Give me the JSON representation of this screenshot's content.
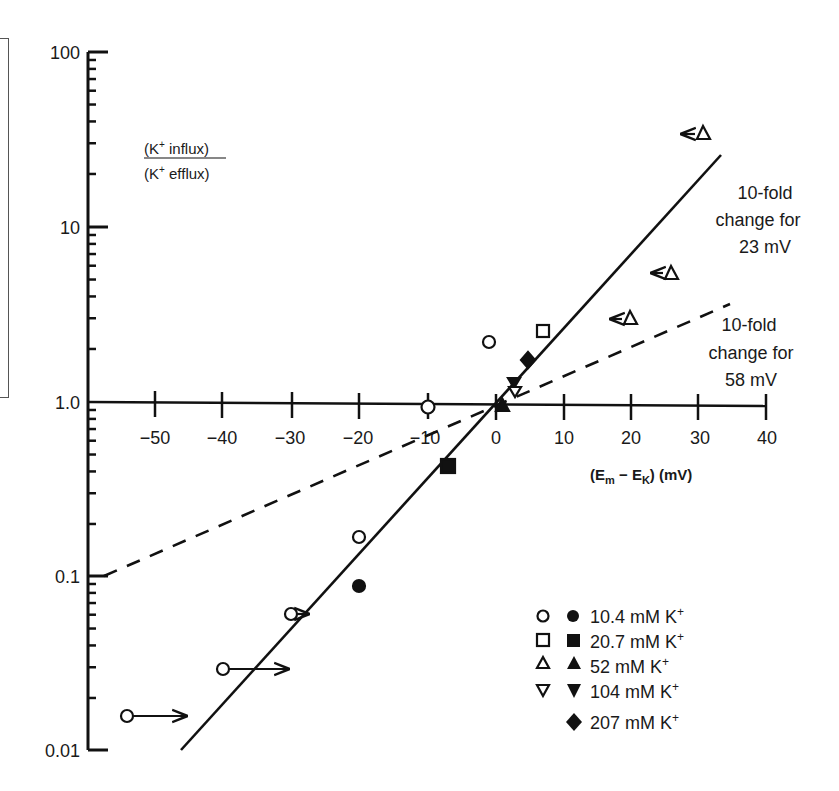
{
  "chart_data": {
    "type": "scatter",
    "title": "",
    "xlabel": "(Em − EK) (mV)",
    "ylabel": "(K+ influx) / (K+ efflux)",
    "ylabel_numerator": "(K+ influx)",
    "ylabel_denominator": "(K+ efflux)",
    "yscale": "log",
    "xlim": [
      -55,
      40
    ],
    "ylim": [
      0.01,
      100
    ],
    "x_ticks": [
      -50,
      -40,
      -30,
      -20,
      -10,
      0,
      10,
      20,
      30,
      40
    ],
    "x_tick_labels": [
      "−50",
      "−40",
      "−30",
      "−20",
      "−10",
      "0",
      "10",
      "20",
      "30",
      "40"
    ],
    "y_ticks": [
      100,
      10,
      1.0,
      0.1,
      0.01
    ],
    "y_tick_labels": [
      "100",
      "10",
      "1.0",
      "0.1",
      "0.01"
    ],
    "grid": false,
    "legend_position": "lower right",
    "series": [
      {
        "name": "10.4 mM K+",
        "marker": "circle",
        "open_points": [
          {
            "x": -53.5,
            "y": 0.016,
            "arrow": "right"
          },
          {
            "x": -40,
            "y": 0.029,
            "arrow": "right"
          },
          {
            "x": -30,
            "y": 0.061,
            "arrow": "right"
          },
          {
            "x": -20,
            "y": 0.17
          },
          {
            "x": -10,
            "y": 0.95
          },
          {
            "x": -1,
            "y": 2.2
          }
        ],
        "filled_points": [
          {
            "x": -20,
            "y": 0.088
          }
        ]
      },
      {
        "name": "20.7 mM K+",
        "marker": "square",
        "open_points": [
          {
            "x": 7,
            "y": 2.5
          }
        ],
        "filled_points": [
          {
            "x": -7,
            "y": 0.43
          }
        ]
      },
      {
        "name": "52 mM K+",
        "marker": "triangle-up",
        "open_points": [
          {
            "x": 30,
            "y": 34,
            "arrow": "left"
          },
          {
            "x": 25,
            "y": 5.5,
            "arrow": "left"
          },
          {
            "x": 20,
            "y": 3.0,
            "arrow": "left"
          }
        ],
        "filled_points": [
          {
            "x": 1,
            "y": 0.97
          }
        ]
      },
      {
        "name": "104 mM K+",
        "marker": "triangle-down",
        "open_points": [
          {
            "x": 3,
            "y": 1.15
          }
        ],
        "filled_points": [
          {
            "x": 3,
            "y": 1.28
          }
        ]
      },
      {
        "name": "207 mM K+",
        "marker": "diamond",
        "open_points": [],
        "filled_points": [
          {
            "x": 5,
            "y": 1.7
          }
        ]
      }
    ],
    "lines": [
      {
        "name": "10-fold change for 23 mV",
        "style": "solid",
        "slope_mV_per_decade": 23,
        "x_range": [
          -46,
          33
        ]
      },
      {
        "name": "10-fold change for 58 mV",
        "style": "dashed",
        "slope_mV_per_decade": 58,
        "x_range": [
          -57,
          34
        ]
      }
    ],
    "annotations": [
      {
        "text": [
          "10-fold",
          "change for",
          "23 mV"
        ]
      },
      {
        "text": [
          "10-fold",
          "change for",
          "58 mV"
        ]
      }
    ]
  },
  "labels": {
    "ratio_num": "(K",
    "ratio_num_rest": " influx)",
    "ratio_den": "(K",
    "ratio_den_rest": " efflux)",
    "sup_plus": "+",
    "x_title_open": "(E",
    "x_title_sub_m": "m",
    "x_title_mid": " − E",
    "x_title_sub_k": "K",
    "x_title_close": ") (mV)",
    "annot23": [
      "10-fold",
      "change for",
      "23 mV"
    ],
    "annot58": [
      "10-fold",
      "change for",
      "58 mV"
    ],
    "y_ticks": [
      "100",
      "10",
      "1.0",
      "0.1",
      "0.01"
    ],
    "x_ticks": [
      "−50",
      "−40",
      "−30",
      "−20",
      "−10",
      "0",
      "10",
      "20",
      "30",
      "40"
    ],
    "legend": [
      {
        "label": "10.4 mM K",
        "sup": "+"
      },
      {
        "label": "20.7 mM K",
        "sup": "+"
      },
      {
        "label": "52 mM K",
        "sup": "+"
      },
      {
        "label": "104 mM K",
        "sup": "+"
      },
      {
        "label": "207 mM K",
        "sup": "+"
      }
    ]
  }
}
